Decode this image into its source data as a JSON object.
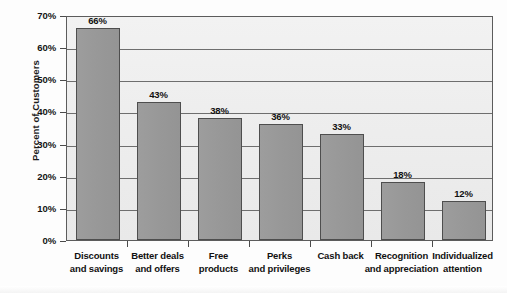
{
  "chart_data": {
    "type": "bar",
    "title": "",
    "subtitle": "",
    "xlabel": "",
    "ylabel": "Percent of Customers",
    "ylim": [
      0,
      70
    ],
    "ytick_step": 10,
    "grid": true,
    "legend": false,
    "legend_position": "none",
    "orientation": "vertical",
    "bar_color": "#989898",
    "bar_border_color": "#4e4e4e",
    "plot_background": "#eeeeee",
    "gridline_color": "#6e6e6e",
    "axis_color": "#5c5c5c",
    "text_color": "#111111",
    "categories": [
      "Discounts and savings",
      "Better deals and offers",
      "Free products",
      "Perks and privileges",
      "Cash back",
      "Recognition and appreciation",
      "Individualized attention"
    ],
    "category_lines": [
      [
        "Discounts",
        "and savings"
      ],
      [
        "Better deals",
        "and offers"
      ],
      [
        "Free",
        "products"
      ],
      [
        "Perks",
        "and privileges"
      ],
      [
        "Cash back",
        ""
      ],
      [
        "Recognition",
        "and appreciation"
      ],
      [
        "Individualized",
        "attention"
      ]
    ],
    "values": [
      66,
      43,
      38,
      36,
      33,
      18,
      12
    ],
    "value_labels": [
      "66%",
      "43%",
      "38%",
      "36%",
      "33%",
      "18%",
      "12%"
    ],
    "ytick_labels": [
      "70%",
      "60%",
      "50%",
      "40%",
      "30%",
      "20%",
      "10%",
      "0%"
    ],
    "ytick_values": [
      70,
      60,
      50,
      40,
      30,
      20,
      10,
      0
    ]
  }
}
